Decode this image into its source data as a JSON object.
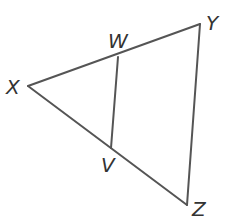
{
  "diagram": {
    "type": "triangle with interior segment",
    "color": "#555555",
    "points": {
      "X": {
        "label": "X",
        "x": 28,
        "y": 86
      },
      "W": {
        "label": "W",
        "x": 118,
        "y": 57
      },
      "Y": {
        "label": "Y",
        "x": 200,
        "y": 24
      },
      "V": {
        "label": "V",
        "x": 111,
        "y": 148
      },
      "Z": {
        "label": "Z",
        "x": 187,
        "y": 205
      }
    },
    "segments": [
      "XY",
      "YZ",
      "XZ",
      "WV"
    ]
  }
}
